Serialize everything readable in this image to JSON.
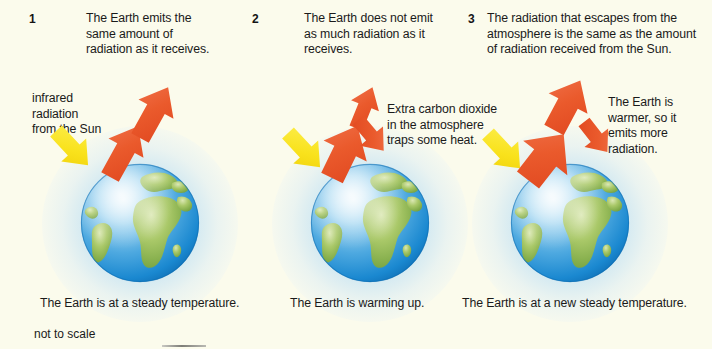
{
  "figure": {
    "background_color": "#fbfbec",
    "footnote": "not to scale",
    "globe_glow_color": "#b0d8f0",
    "arrow_colors": {
      "emitted_radiation": "#e8562a",
      "incoming_solar": "#f9e21c"
    }
  },
  "panels": [
    {
      "number": "1",
      "heading": "The Earth emits the same amount of radiation as it receives.",
      "incoming_label": "infrared radiation from the Sun",
      "caption": "The Earth is at a steady temperature.",
      "globe_name": "earth-globe",
      "arrows": [
        {
          "name": "incoming-solar-arrow",
          "color": "#f9e21c",
          "direction": "down-right"
        },
        {
          "name": "outgoing-radiation-arrow-lower",
          "color": "#e8562a",
          "direction": "up-right"
        },
        {
          "name": "outgoing-radiation-arrow-upper",
          "color": "#e8562a",
          "direction": "up-right"
        }
      ]
    },
    {
      "number": "2",
      "heading": "The Earth does not emit as much radiation as it receives.",
      "side_label": "Extra carbon dioxide in the atmosphere traps some heat.",
      "caption": "The Earth is warming up.",
      "globe_name": "earth-globe",
      "arrows": [
        {
          "name": "incoming-solar-arrow",
          "color": "#f9e21c",
          "direction": "down-right"
        },
        {
          "name": "outgoing-radiation-arrow-main",
          "color": "#e8562a",
          "direction": "up-right"
        },
        {
          "name": "escaping-radiation-arrow",
          "color": "#e8562a",
          "direction": "up-right"
        },
        {
          "name": "trapped-heat-arrow",
          "color": "#e8562a",
          "direction": "down-right"
        }
      ]
    },
    {
      "number": "3",
      "heading": "The radiation that escapes from the atmosphere is the same as the amount of radiation received from the Sun.",
      "side_label": "The Earth is warmer, so it emits more radiation.",
      "caption": "The Earth is at a new steady temperature.",
      "globe_name": "earth-globe",
      "arrows": [
        {
          "name": "incoming-solar-arrow",
          "color": "#f9e21c",
          "direction": "down-right"
        },
        {
          "name": "outgoing-radiation-arrow-main",
          "color": "#e8562a",
          "direction": "up-right"
        },
        {
          "name": "escaping-radiation-arrow",
          "color": "#e8562a",
          "direction": "up-right"
        },
        {
          "name": "trapped-heat-arrow",
          "color": "#e8562a",
          "direction": "down-right"
        }
      ]
    }
  ]
}
